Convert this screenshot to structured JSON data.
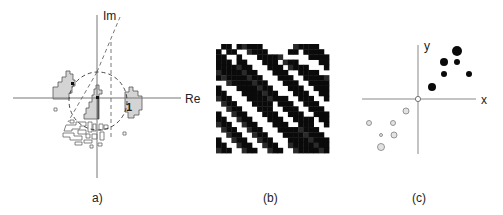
{
  "panels": [
    {
      "id": "a",
      "caption": "a)",
      "axes": {
        "horizontal_label": "Re",
        "vertical_label": "Im"
      },
      "unit_circle_label": "1",
      "description": "Complex plane with dashed unit circle, gray eigenvalue regions and outlined fragments"
    },
    {
      "id": "b",
      "caption": "(b)",
      "description": "Black and white diagonal stripe (labyrinth) pattern on pixel grid"
    },
    {
      "id": "c",
      "caption": "(c)",
      "axes": {
        "horizontal_label": "x",
        "vertical_label": "y"
      },
      "description": "Scatter of black dots in first quadrant and gray hollow dots in third quadrant, open circle at origin"
    }
  ],
  "colors": {
    "axis": "#777777",
    "region_fill": "#d4d4d4",
    "region_stroke": "#555555",
    "dark": "#0a0a0a",
    "gray_dot_fill": "#e2e2e2",
    "gray_dot_stroke": "#8a8a8a"
  },
  "stripes_grid": {
    "cols": 22,
    "rows": 21,
    "rows_data": [
      "0110111110000001111100",
      "1011001111000011011110",
      "1100100011111000001111",
      "1110110001110111000011",
      "1111111000111011110001",
      "1111111100011100111100",
      "1111111110001110011111",
      "0011111111000111001111",
      "1000111111100011100111",
      "1100011111110001110011",
      "1110001111111100111001",
      "0111000111101110011100",
      "0011100011100111001110",
      "1001110001110011100111",
      "1100111000111001111011",
      "1110011100011100111001",
      "0111001110001111111100",
      "0011100111000111111110",
      "1001110011100011111111",
      "1100111001110011111111",
      "1110011100111001111111"
    ]
  }
}
